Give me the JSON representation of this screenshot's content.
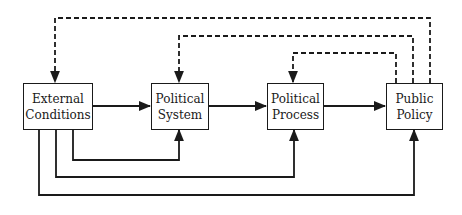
{
  "diagram": {
    "type": "flow-diagram",
    "nodes": [
      {
        "id": "external",
        "line1": "External",
        "line2": "Conditions"
      },
      {
        "id": "system",
        "line1": "Political",
        "line2": "System"
      },
      {
        "id": "process",
        "line1": "Political",
        "line2": "Process"
      },
      {
        "id": "policy",
        "line1": "Public",
        "line2": "Policy"
      }
    ],
    "edges": {
      "forward_solid": [
        {
          "from": "External Conditions",
          "to": "Political System"
        },
        {
          "from": "Political System",
          "to": "Political Process"
        },
        {
          "from": "Political Process",
          "to": "Public Policy"
        }
      ],
      "bottom_solid": [
        {
          "from": "External Conditions",
          "to": "Political System"
        },
        {
          "from": "External Conditions",
          "to": "Political Process"
        },
        {
          "from": "External Conditions",
          "to": "Public Policy"
        }
      ],
      "feedback_dashed": [
        {
          "from": "Public Policy",
          "to": "External Conditions"
        },
        {
          "from": "Public Policy",
          "to": "Political System"
        },
        {
          "from": "Public Policy",
          "to": "Political Process"
        }
      ]
    },
    "colors": {
      "line": "#1a1a1a",
      "background": "#ffffff"
    }
  }
}
